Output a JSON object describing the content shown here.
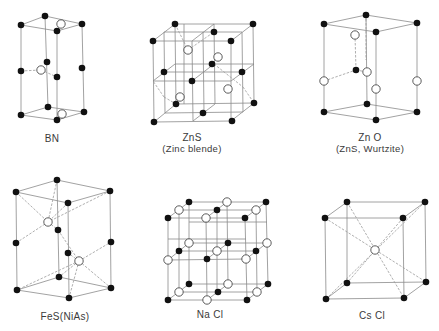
{
  "figure": {
    "colors": {
      "line": "#8a8a8a",
      "dash": "#9a9a9a",
      "filled_atom": "#111111",
      "open_atom_fill": "#ffffff",
      "open_atom_stroke": "#333333",
      "text": "#3a3a3a"
    },
    "structures": [
      {
        "id": "bn",
        "label": "BN",
        "sublabel": "",
        "label_pos": [
          52,
          133
        ],
        "edges": [
          [
            21,
            25,
            45,
            16
          ],
          [
            45,
            16,
            82,
            24
          ],
          [
            82,
            24,
            57,
            31
          ],
          [
            57,
            31,
            21,
            25
          ],
          [
            21,
            115,
            48,
            107
          ],
          [
            48,
            107,
            84,
            112
          ],
          [
            84,
            112,
            57,
            120
          ],
          [
            57,
            120,
            21,
            115
          ],
          [
            21,
            25,
            21,
            115
          ],
          [
            45,
            16,
            48,
            107
          ],
          [
            82,
            24,
            84,
            112
          ],
          [
            57,
            31,
            57,
            120
          ]
        ],
        "dashes": [
          [
            21,
            71,
            41,
            70
          ],
          [
            41,
            70,
            57,
            77
          ]
        ],
        "filled": [
          [
            21,
            25
          ],
          [
            45,
            16
          ],
          [
            82,
            24
          ],
          [
            57,
            31
          ],
          [
            21,
            71
          ],
          [
            47,
            62
          ],
          [
            82,
            68
          ],
          [
            57,
            77
          ],
          [
            21,
            115
          ],
          [
            48,
            107
          ],
          [
            84,
            112
          ],
          [
            57,
            120
          ]
        ],
        "open": [
          [
            61,
            24
          ],
          [
            41,
            70
          ],
          [
            62,
            114
          ]
        ]
      },
      {
        "id": "zns-zinc-blende",
        "label": "ZnS",
        "sublabel": "(Zinc blende)",
        "label_pos": [
          192,
          132
        ],
        "edges": [
          [
            153,
            41,
            231,
            41
          ],
          [
            231,
            41,
            231,
            121
          ],
          [
            231,
            121,
            154,
            122
          ],
          [
            154,
            122,
            153,
            41
          ],
          [
            175,
            24,
            253,
            24
          ],
          [
            253,
            24,
            254,
            103
          ],
          [
            254,
            103,
            176,
            104
          ],
          [
            176,
            104,
            175,
            24
          ],
          [
            153,
            41,
            175,
            24
          ],
          [
            231,
            41,
            253,
            24
          ],
          [
            231,
            121,
            254,
            103
          ],
          [
            154,
            122,
            176,
            104
          ],
          [
            192,
            41,
            214,
            24
          ],
          [
            192,
            41,
            193,
            121
          ],
          [
            193,
            121,
            215,
            104
          ],
          [
            214,
            24,
            215,
            104
          ],
          [
            153,
            81,
            231,
            81
          ],
          [
            231,
            81,
            254,
            64
          ],
          [
            254,
            64,
            175,
            64
          ],
          [
            175,
            64,
            153,
            81
          ],
          [
            164,
            32,
            242,
            32
          ],
          [
            164,
            32,
            165,
            113
          ],
          [
            242,
            32,
            243,
            112
          ],
          [
            165,
            113,
            243,
            112
          ],
          [
            203,
            32,
            204,
            113
          ],
          [
            164,
            72,
            242,
            72
          ],
          [
            192,
            81,
            214,
            64
          ],
          [
            184,
            104,
            184,
            24
          ]
        ],
        "dashes": [
          [
            175,
            24,
            188,
            50
          ],
          [
            188,
            50,
            214,
            32
          ],
          [
            214,
            64,
            243,
            87
          ],
          [
            243,
            87,
            254,
            103
          ],
          [
            164,
            97,
            153,
            81
          ],
          [
            164,
            97,
            176,
            104
          ]
        ],
        "filled": [
          [
            175,
            24
          ],
          [
            253,
            24
          ],
          [
            153,
            41
          ],
          [
            231,
            41
          ],
          [
            214,
            32
          ],
          [
            212,
            64
          ],
          [
            164,
            72
          ],
          [
            242,
            72
          ],
          [
            192,
            81
          ],
          [
            176,
            104
          ],
          [
            254,
            103
          ],
          [
            203,
            113
          ],
          [
            154,
            122
          ],
          [
            232,
            121
          ]
        ],
        "open": [
          [
            188,
            50
          ],
          [
            218,
            57
          ],
          [
            228,
            89
          ],
          [
            180,
            97
          ]
        ]
      },
      {
        "id": "zno-wurtzite",
        "label": "Zn O",
        "sublabel": "(ZnS, Wurtzite)",
        "label_pos": [
          370,
          132
        ],
        "edges": [
          [
            324,
            24,
            366,
            15
          ],
          [
            366,
            15,
            417,
            23
          ],
          [
            417,
            23,
            376,
            32
          ],
          [
            376,
            32,
            324,
            24
          ],
          [
            324,
            112,
            367,
            104
          ],
          [
            367,
            104,
            417,
            112
          ],
          [
            417,
            112,
            376,
            120
          ],
          [
            376,
            120,
            324,
            112
          ],
          [
            324,
            24,
            324,
            112
          ],
          [
            376,
            32,
            376,
            120
          ],
          [
            417,
            23,
            417,
            112
          ],
          [
            366,
            15,
            367,
            104
          ]
        ],
        "dashes": [
          [
            355,
            35,
            356,
            70
          ],
          [
            324,
            81,
            356,
            70
          ],
          [
            356,
            70,
            367,
            72
          ],
          [
            366,
            15,
            366,
            60
          ]
        ],
        "filled": [
          [
            324,
            24
          ],
          [
            366,
            15
          ],
          [
            417,
            23
          ],
          [
            376,
            32
          ],
          [
            356,
            70
          ],
          [
            324,
            112
          ],
          [
            367,
            104
          ],
          [
            417,
            112
          ],
          [
            376,
            120
          ]
        ],
        "open": [
          [
            355,
            35
          ],
          [
            324,
            81
          ],
          [
            367,
            72
          ],
          [
            376,
            89
          ],
          [
            417,
            81
          ]
        ]
      },
      {
        "id": "fes-nias",
        "label": "FeS(NiAs)",
        "sublabel": "",
        "label_pos": [
          65,
          311
        ],
        "edges": [
          [
            16,
            192,
            57,
            180
          ],
          [
            57,
            180,
            110,
            191
          ],
          [
            110,
            191,
            68,
            203
          ],
          [
            68,
            203,
            16,
            192
          ],
          [
            17,
            290,
            59,
            277
          ],
          [
            59,
            277,
            111,
            288
          ],
          [
            111,
            288,
            69,
            298
          ],
          [
            69,
            298,
            17,
            290
          ],
          [
            16,
            192,
            17,
            290
          ],
          [
            68,
            203,
            69,
            298
          ],
          [
            110,
            191,
            111,
            288
          ],
          [
            57,
            180,
            59,
            277
          ]
        ],
        "dashes": [
          [
            16,
            192,
            48,
            222
          ],
          [
            57,
            180,
            48,
            222
          ],
          [
            110,
            191,
            48,
            222
          ],
          [
            68,
            203,
            48,
            222
          ],
          [
            16,
            243,
            48,
            222
          ],
          [
            48,
            222,
            58,
            230
          ],
          [
            58,
            230,
            79,
            261
          ],
          [
            79,
            261,
            111,
            242
          ],
          [
            79,
            261,
            68,
            253
          ],
          [
            79,
            261,
            59,
            277
          ],
          [
            79,
            261,
            111,
            288
          ],
          [
            79,
            261,
            69,
            298
          ],
          [
            79,
            261,
            17,
            290
          ]
        ],
        "filled": [
          [
            16,
            192
          ],
          [
            57,
            180
          ],
          [
            110,
            191
          ],
          [
            68,
            203
          ],
          [
            16,
            243
          ],
          [
            58,
            230
          ],
          [
            68,
            253
          ],
          [
            111,
            242
          ],
          [
            17,
            290
          ],
          [
            59,
            277
          ],
          [
            111,
            288
          ],
          [
            69,
            298
          ]
        ],
        "open": [
          [
            48,
            222
          ],
          [
            79,
            261
          ]
        ]
      },
      {
        "id": "nacl",
        "label": "Na Cl",
        "sublabel": "",
        "label_pos": [
          210,
          309
        ],
        "edges": [
          [
            168,
            218,
            245,
            218
          ],
          [
            245,
            218,
            266,
            202
          ],
          [
            266,
            202,
            189,
            202
          ],
          [
            189,
            202,
            168,
            218
          ],
          [
            168,
            300,
            247,
            300
          ],
          [
            247,
            300,
            268,
            284
          ],
          [
            268,
            284,
            189,
            284
          ],
          [
            189,
            284,
            168,
            300
          ],
          [
            168,
            218,
            168,
            300
          ],
          [
            245,
            218,
            247,
            300
          ],
          [
            266,
            202,
            268,
            284
          ],
          [
            189,
            202,
            189,
            284
          ],
          [
            168,
            260,
            246,
            259
          ],
          [
            246,
            259,
            267,
            243
          ],
          [
            267,
            243,
            189,
            243
          ],
          [
            189,
            243,
            168,
            260
          ],
          [
            206,
            218,
            207,
            300
          ],
          [
            227,
            202,
            228,
            284
          ],
          [
            179,
            210,
            256,
            210
          ],
          [
            179,
            292,
            257,
            292
          ],
          [
            217,
            210,
            217,
            292
          ],
          [
            179,
            210,
            179,
            292
          ],
          [
            256,
            210,
            257,
            292
          ],
          [
            179,
            251,
            256,
            251
          ],
          [
            206,
            218,
            227,
            202
          ],
          [
            207,
            300,
            228,
            284
          ],
          [
            207,
            259,
            228,
            243
          ],
          [
            168,
            239,
            246,
            239
          ],
          [
            189,
            222,
            267,
            222
          ]
        ],
        "dashes": [],
        "filled": [
          [
            189,
            202
          ],
          [
            266,
            202
          ],
          [
            217,
            210
          ],
          [
            168,
            218
          ],
          [
            245,
            218
          ],
          [
            228,
            243
          ],
          [
            179,
            251
          ],
          [
            256,
            251
          ],
          [
            207,
            259
          ],
          [
            189,
            284
          ],
          [
            268,
            284
          ],
          [
            218,
            292
          ],
          [
            168,
            300
          ],
          [
            247,
            300
          ]
        ],
        "open": [
          [
            227,
            202
          ],
          [
            179,
            210
          ],
          [
            256,
            210
          ],
          [
            206,
            218
          ],
          [
            189,
            243
          ],
          [
            267,
            243
          ],
          [
            217,
            251
          ],
          [
            168,
            260
          ],
          [
            246,
            259
          ],
          [
            228,
            284
          ],
          [
            179,
            292
          ],
          [
            257,
            292
          ],
          [
            207,
            300
          ]
        ]
      },
      {
        "id": "cscl",
        "label": "Cs Cl",
        "sublabel": "",
        "label_pos": [
          372,
          310
        ],
        "edges": [
          [
            325,
            218,
            403,
            218
          ],
          [
            403,
            218,
            404,
            298
          ],
          [
            404,
            298,
            326,
            299
          ],
          [
            326,
            299,
            325,
            218
          ],
          [
            347,
            202,
            425,
            202
          ],
          [
            425,
            202,
            426,
            282
          ],
          [
            426,
            282,
            347,
            283
          ],
          [
            347,
            283,
            347,
            202
          ],
          [
            325,
            218,
            347,
            202
          ],
          [
            403,
            218,
            425,
            202
          ],
          [
            404,
            298,
            426,
            282
          ],
          [
            326,
            299,
            347,
            283
          ]
        ],
        "dashes": [
          [
            325,
            218,
            426,
            282
          ],
          [
            403,
            218,
            347,
            283
          ],
          [
            347,
            202,
            404,
            298
          ],
          [
            425,
            202,
            326,
            299
          ]
        ],
        "filled": [
          [
            325,
            218
          ],
          [
            403,
            218
          ],
          [
            347,
            202
          ],
          [
            425,
            202
          ],
          [
            326,
            299
          ],
          [
            404,
            298
          ],
          [
            347,
            283
          ],
          [
            426,
            282
          ]
        ],
        "open": [
          [
            375,
            250
          ]
        ]
      }
    ]
  }
}
